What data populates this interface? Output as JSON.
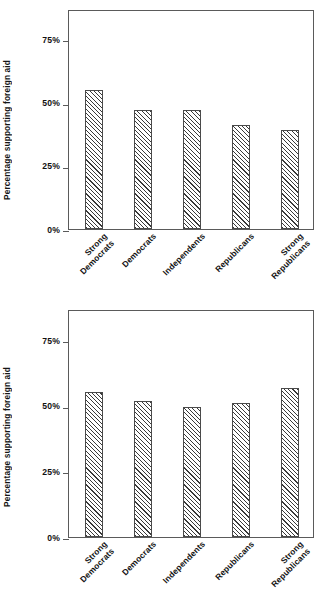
{
  "chart_data": {
    "type": "bar",
    "xlabel": "",
    "ylabel": "Percentage supporting foreign aid",
    "categories": [
      "Strong Democrats",
      "Democrats",
      "Independents",
      "Republicans",
      "Strong Republicans"
    ],
    "ylim": [
      0,
      87
    ],
    "yticks": [
      0,
      25,
      50,
      75
    ],
    "ytick_labels": [
      "0%",
      "25%",
      "50%",
      "75%"
    ],
    "grid": false,
    "legend": "none",
    "panels": [
      {
        "title": "Non-South",
        "values": [
          55,
          47,
          47,
          41,
          39
        ]
      },
      {
        "title": "South",
        "values": [
          55.5,
          52,
          49.5,
          51,
          57
        ]
      }
    ]
  },
  "figure": {
    "caption": "",
    "bar_fill": "hatch-45",
    "bar_edge_color": "#4a4a4a",
    "frame_color": "#5a5a5a",
    "background": "#ffffff"
  },
  "panels": [
    {
      "title": "Non-South",
      "ylabel": "Percentage supporting foreign aid",
      "ytick_labels": [
        "75%",
        "50%",
        "25%",
        "0%"
      ],
      "bars": [
        {
          "label_line1": "Strong",
          "label_line2": "Democrats",
          "value": 55
        },
        {
          "label_line1": "Democrats",
          "label_line2": "",
          "value": 47
        },
        {
          "label_line1": "Independents",
          "label_line2": "",
          "value": 47
        },
        {
          "label_line1": "Republicans",
          "label_line2": "",
          "value": 41
        },
        {
          "label_line1": "Strong",
          "label_line2": "Republicans",
          "value": 39
        }
      ]
    },
    {
      "title": "South",
      "ylabel": "Percentage supporting foreign aid",
      "ytick_labels": [
        "75%",
        "50%",
        "25%",
        "0%"
      ],
      "bars": [
        {
          "label_line1": "Strong",
          "label_line2": "Democrats",
          "value": 55.5
        },
        {
          "label_line1": "Democrats",
          "label_line2": "",
          "value": 52
        },
        {
          "label_line1": "Independents",
          "label_line2": "",
          "value": 49.5
        },
        {
          "label_line1": "Republicans",
          "label_line2": "",
          "value": 51
        },
        {
          "label_line1": "Strong",
          "label_line2": "Republicans",
          "value": 57
        }
      ]
    }
  ]
}
